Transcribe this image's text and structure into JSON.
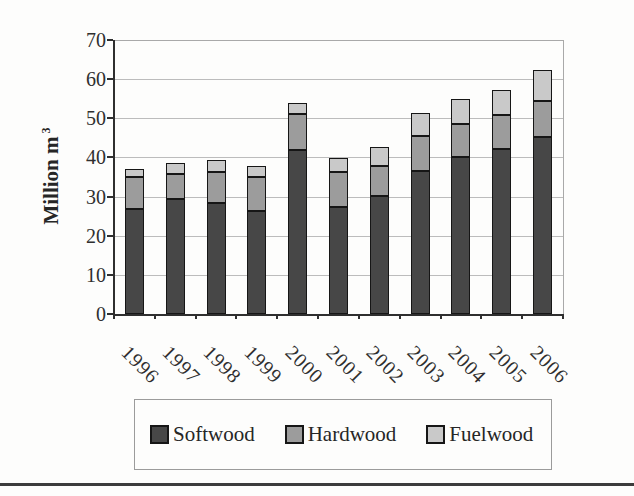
{
  "chart_data": {
    "type": "bar",
    "stacked": true,
    "title": "",
    "ylabel": "Million m",
    "ylabel_superscript": "3",
    "xlabel": "",
    "categories": [
      "1996",
      "1997",
      "1998",
      "1999",
      "2000",
      "2001",
      "2002",
      "2003",
      "2004",
      "2005",
      "2006"
    ],
    "series": [
      {
        "name": "Softwood",
        "color": "#474747",
        "values": [
          26.8,
          29.5,
          28.4,
          26.4,
          41.8,
          27.4,
          30.2,
          36.6,
          40.0,
          42.2,
          45.2
        ]
      },
      {
        "name": "Hardwood",
        "color": "#9c9c9c",
        "values": [
          8.1,
          6.2,
          7.9,
          8.7,
          9.3,
          9.0,
          7.7,
          8.9,
          8.6,
          8.7,
          9.1
        ]
      },
      {
        "name": "Fuelwood",
        "color": "#c9c9c9",
        "values": [
          2.1,
          2.8,
          3.1,
          2.6,
          2.9,
          3.5,
          4.8,
          5.8,
          6.2,
          6.2,
          8.1
        ]
      }
    ],
    "totals": [
      37.0,
      38.5,
      39.4,
      37.7,
      54.0,
      39.9,
      42.7,
      51.3,
      54.8,
      57.1,
      62.4
    ],
    "ylim": [
      0,
      70
    ],
    "yticks": [
      "0",
      "10",
      "20",
      "30",
      "40",
      "50",
      "60",
      "70"
    ],
    "grid": "horizontal",
    "gridline_color": "#bcbcbc",
    "bar_border_color": "#161616",
    "axis_color": "#2f2f2f",
    "frame_color": "#a9a9a9",
    "legend_position": "bottom",
    "legend_items": [
      "Softwood",
      "Hardwood",
      "Fuelwood"
    ]
  }
}
